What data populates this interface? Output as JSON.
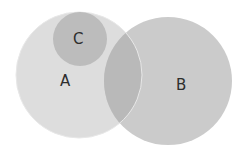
{
  "diagram": {
    "type": "venn",
    "sets": [
      {
        "id": "A",
        "label": "A",
        "cx": 79,
        "cy": 75,
        "r": 63,
        "color": "#dddddd"
      },
      {
        "id": "B",
        "label": "B",
        "cx": 168,
        "cy": 81,
        "r": 64,
        "color": "#cbcbcb"
      },
      {
        "id": "C",
        "label": "C",
        "cx": 80,
        "cy": 39,
        "r": 27,
        "color": "#bcbcbc"
      }
    ],
    "overlap_color": "#b9b9b9",
    "labels": {
      "A": "A",
      "B": "B",
      "C": "C"
    }
  }
}
